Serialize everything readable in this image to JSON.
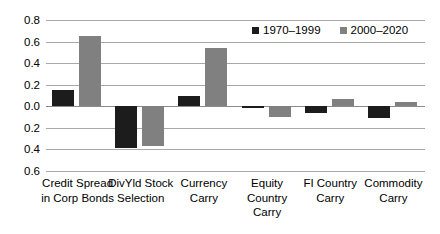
{
  "chart_data": {
    "type": "bar",
    "title": "",
    "subtitle": "",
    "xlabel": "",
    "ylabel": "",
    "ylim": [
      -0.6,
      0.8
    ],
    "grid": true,
    "legend_position": "top-right",
    "categories": [
      "Credit Spread in Corp Bonds",
      "DivYld Stock Selection",
      "Currency Carry",
      "Equity Country Carry",
      "FI Country Carry",
      "Commodity Carry"
    ],
    "category_lines": [
      [
        "Credit Spread",
        "in Corp Bonds"
      ],
      [
        "DivYld Stock",
        "Selection"
      ],
      [
        "Currency",
        "Carry"
      ],
      [
        "Equity Country",
        "Carry"
      ],
      [
        "FI Country",
        "Carry"
      ],
      [
        "Commodity",
        "Carry"
      ]
    ],
    "series": [
      {
        "name": "1970–1999",
        "color": "#1c1c1c",
        "values": [
          0.15,
          -0.39,
          0.1,
          -0.01,
          -0.06,
          -0.11
        ]
      },
      {
        "name": "2000–2020",
        "color": "#808080",
        "values": [
          0.655,
          -0.37,
          0.545,
          -0.1,
          0.07,
          0.04
        ]
      }
    ],
    "yticks": [
      0.8,
      0.6,
      0.4,
      0.2,
      0.0,
      -0.2,
      -0.4,
      -0.6
    ],
    "ytick_labels": [
      "0.8",
      "0.6",
      "0.4",
      "0.2",
      "0.0",
      "0.2",
      "0.4",
      "0.6"
    ]
  },
  "legend": {
    "items": [
      {
        "label": "1970–1999",
        "color": "#1c1c1c"
      },
      {
        "label": "2000–2020",
        "color": "#808080"
      }
    ]
  }
}
